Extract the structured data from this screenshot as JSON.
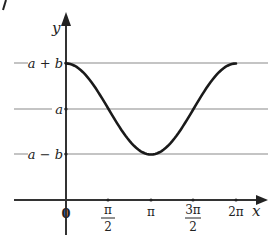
{
  "chart_data": {
    "type": "line",
    "title": "",
    "xlabel": "x",
    "ylabel": "y",
    "function": "y = a + b·cos(x)",
    "xlim": [
      0,
      6.2832
    ],
    "x_ticks": [
      {
        "value": 0,
        "label": "0"
      },
      {
        "value": 1.5708,
        "label_num": "π",
        "label_den": "2"
      },
      {
        "value": 3.1416,
        "label": "π"
      },
      {
        "value": 4.7124,
        "label_num": "3π",
        "label_den": "2"
      },
      {
        "value": 6.2832,
        "label": "2π"
      }
    ],
    "y_levels": [
      {
        "key": "max",
        "label": "a + b"
      },
      {
        "key": "mid",
        "label": "a"
      },
      {
        "key": "min",
        "label": "a − b"
      }
    ],
    "points": [
      {
        "x": 0,
        "y": "a+b"
      },
      {
        "x": 1.5708,
        "y": "a"
      },
      {
        "x": 3.1416,
        "y": "a−b"
      },
      {
        "x": 4.7124,
        "y": "a"
      },
      {
        "x": 6.2832,
        "y": "a+b"
      }
    ],
    "grid": "horizontal lines at a+b, a, a−b",
    "colors": {
      "curve": "#1a1a1a",
      "axis": "#333333",
      "grid": "#8a8a8a"
    }
  },
  "axes": {
    "x_label": "x",
    "y_label": "y",
    "origin_label": "0"
  },
  "ticks": {
    "pi_half_num": "π",
    "pi_half_den": "2",
    "pi": "π",
    "three_pi_half_num": "3π",
    "three_pi_half_den": "2",
    "two_pi": "2π"
  },
  "levels": {
    "max": "a + b",
    "mid": "a",
    "min": "a − b"
  }
}
